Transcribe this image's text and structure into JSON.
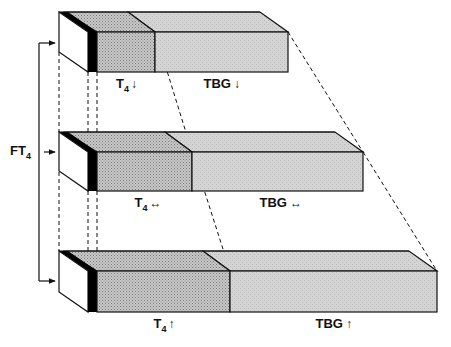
{
  "diagram": {
    "side_label": {
      "main": "FT",
      "sub": "4"
    },
    "colors": {
      "free_t4_face": "#ffffff",
      "black_stripe": "#000000",
      "t4_fill": "#bdbdbd",
      "tbg_fill": "#d6d6d6",
      "outline": "#111111"
    },
    "rows": [
      {
        "id": "low",
        "t4_label": {
          "main": "T",
          "sub": "4",
          "arrow": "↓"
        },
        "tbg_label": {
          "main": "TBG",
          "arrow": "↓"
        },
        "y_top": 12,
        "y_front": 32,
        "y_bottom": 72,
        "t4_end": 155,
        "tbg_end": 288
      },
      {
        "id": "normal",
        "t4_label": {
          "main": "T",
          "sub": "4",
          "arrow": "↔"
        },
        "tbg_label": {
          "main": "TBG",
          "arrow": "↔"
        },
        "y_top": 132,
        "y_front": 152,
        "y_bottom": 191,
        "t4_end": 192,
        "tbg_end": 363
      },
      {
        "id": "high",
        "t4_label": {
          "main": "T",
          "sub": "4",
          "arrow": "↑"
        },
        "tbg_label": {
          "main": "TBG",
          "arrow": "↑"
        },
        "y_top": 251,
        "y_front": 271,
        "y_bottom": 312,
        "t4_end": 230,
        "tbg_end": 437
      }
    ]
  }
}
